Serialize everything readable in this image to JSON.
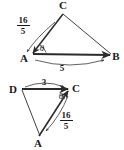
{
  "figure": {
    "kind": "vector-triangle-diagram",
    "background_color": "#ffffff",
    "ink_color": "#2b2b2b",
    "top_diagram": {
      "name": "triangle-ABC",
      "vertices": {
        "A": "A",
        "B": "B",
        "C": "C"
      },
      "angle_label": "θ",
      "vector_AC_magnitude_numerator": "16",
      "vector_AC_magnitude_denominator": "5",
      "vector_AB_magnitude": "5"
    },
    "bottom_diagram": {
      "name": "triangle-DCA",
      "vertices": {
        "D": "D",
        "C": "C",
        "A": "A"
      },
      "angle_label": "θ",
      "vector_DC_magnitude": "3",
      "vector_AC_magnitude_numerator": "16",
      "vector_AC_magnitude_denominator": "5"
    }
  }
}
